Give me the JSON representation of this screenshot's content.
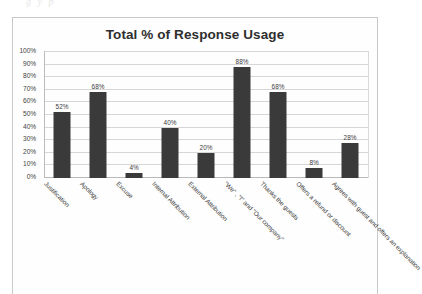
{
  "page": {
    "top_artifact_text": "g              y    p"
  },
  "chart_data": {
    "type": "bar",
    "title": "Total % of Response Usage",
    "xlabel": "",
    "ylabel": "",
    "ylim": [
      0,
      100
    ],
    "ytick_values": [
      100,
      90,
      80,
      70,
      60,
      50,
      40,
      30,
      20,
      10,
      0
    ],
    "ytick_labels": [
      "100%",
      "90%",
      "80%",
      "70%",
      "60%",
      "50%",
      "40%",
      "30%",
      "20%",
      "10%",
      "0%"
    ],
    "grid": true,
    "legend": false,
    "bar_color": "#3a3a3a",
    "categories": [
      "Justification",
      "Apology",
      "Excuse",
      "Internal Attribution",
      "External Attribution",
      "\"We\" , \"I\" and \"Our company\"",
      "Thanks the guests",
      "Offers a refund or discount",
      "Agrees with guest and offers an explanation"
    ],
    "values": [
      52,
      68,
      4,
      40,
      20,
      88,
      68,
      8,
      28
    ],
    "data_labels": [
      "52%",
      "68%",
      "4%",
      "40%",
      "20%",
      "88%",
      "68%",
      "8%",
      "28%"
    ]
  }
}
